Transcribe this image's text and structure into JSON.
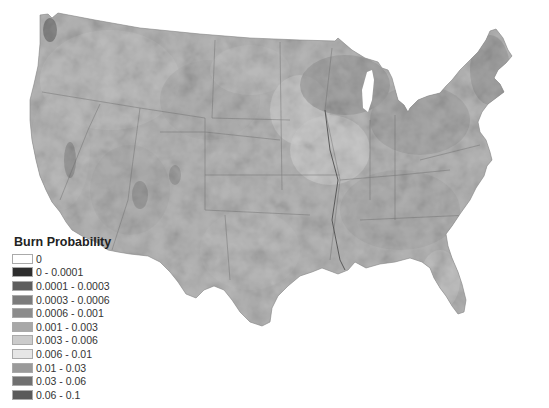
{
  "map": {
    "subject": "Contiguous United States burn probability",
    "fill_style": "grayscale raster",
    "state_borders": true
  },
  "legend": {
    "title": "Burn Probability",
    "items": [
      {
        "label": "0",
        "color": "#ffffff"
      },
      {
        "label": "0 - 0.0001",
        "color": "#2e2e2e"
      },
      {
        "label": "0.0001 - 0.0003",
        "color": "#5e5e5e"
      },
      {
        "label": "0.0003 - 0.0006",
        "color": "#7c7c7c"
      },
      {
        "label": "0.0006 - 0.001",
        "color": "#8c8c8c"
      },
      {
        "label": "0.001 - 0.003",
        "color": "#a8a8a8"
      },
      {
        "label": "0.003 - 0.006",
        "color": "#cbcbcb"
      },
      {
        "label": "0.006 - 0.01",
        "color": "#e6e6e6"
      },
      {
        "label": "0.01 - 0.03",
        "color": "#9a9a9a"
      },
      {
        "label": "0.03 - 0.06",
        "color": "#707070"
      },
      {
        "label": "0.06 - 0.1",
        "color": "#5a5a5a"
      }
    ]
  }
}
